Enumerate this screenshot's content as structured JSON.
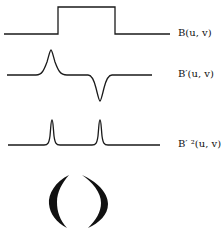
{
  "diagram": {
    "traces": [
      {
        "id": "B",
        "label": "B(u, v)",
        "shape": "step-pulse"
      },
      {
        "id": "B-prime",
        "label": "B′(u, v)",
        "shape": "derivative-peak-and-dip"
      },
      {
        "id": "B-prime-squared",
        "label": "B′ ²(u, v)",
        "shape": "two-narrow-peaks"
      }
    ],
    "bottom_figure": {
      "shape": "pair-of-facing-crescents"
    },
    "colors": {
      "stroke": "#1a1a1a",
      "background": "#ffffff"
    }
  }
}
